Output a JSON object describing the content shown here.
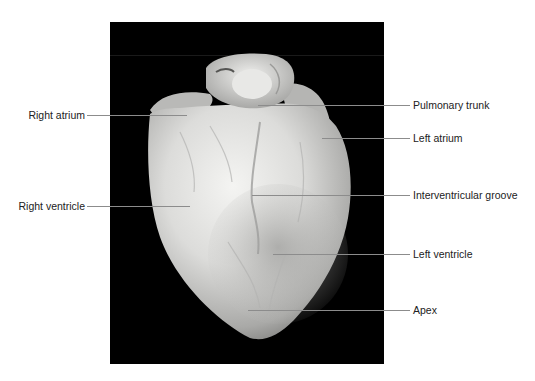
{
  "figure": {
    "background_color": "#000000",
    "leader_color": "#8c8c8c",
    "labels": {
      "right_atrium": "Right atrium",
      "right_ventricle": "Right ventricle",
      "pulmonary_trunk": "Pulmonary trunk",
      "left_atrium": "Left atrium",
      "interventricular_groove": "Interventricular groove",
      "left_ventricle": "Left ventricle",
      "apex": "Apex"
    }
  }
}
